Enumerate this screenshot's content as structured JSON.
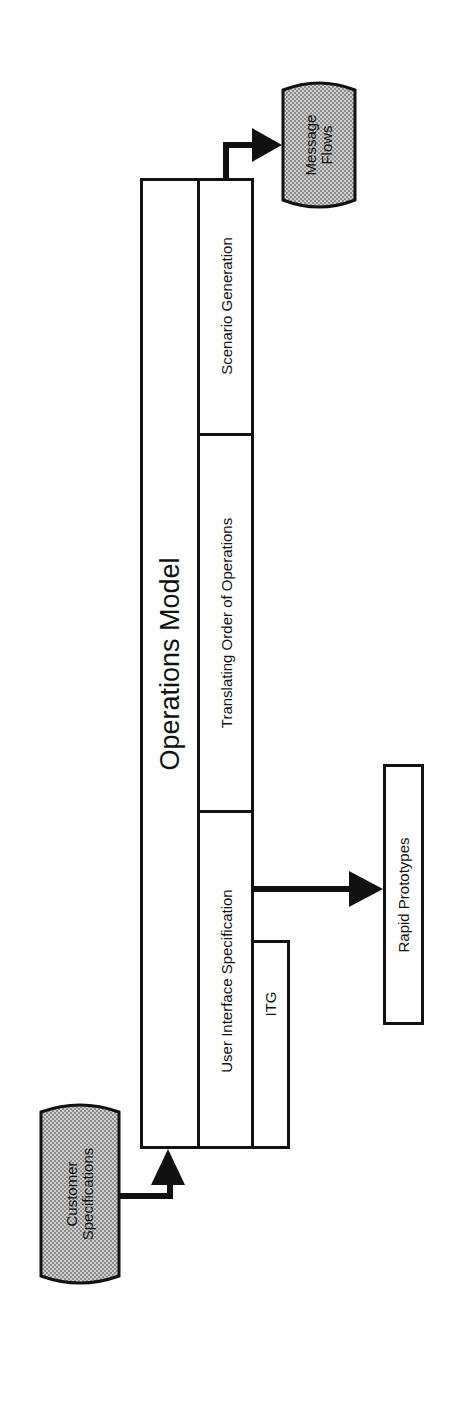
{
  "diagram": {
    "main_box": {
      "title": "Operations Model",
      "sections": [
        {
          "label": "Scenario Generation"
        },
        {
          "label": "Translating Order of Operations"
        },
        {
          "label": "User Interface Specification"
        }
      ]
    },
    "sub_box": {
      "label": "ITG"
    },
    "outputs": {
      "rapid_prototypes": {
        "label": "Rapid Prototypes"
      },
      "message_flows": {
        "label_line1": "Message",
        "label_line2": "Flows"
      }
    },
    "inputs": {
      "customer_specifications": {
        "label_line1": "Customer",
        "label_line2": "Specifications"
      }
    },
    "colors": {
      "line": "#111111",
      "terminal_fill": "#bdbdbd",
      "background": "#ffffff"
    }
  }
}
